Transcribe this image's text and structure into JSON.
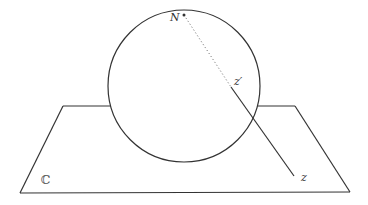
{
  "diagram": {
    "colors": {
      "stroke": "#333333",
      "background": "#ffffff",
      "dotted": "#666666"
    },
    "plane": {
      "label": "ℂ",
      "corners": [
        [
          63,
          106
        ],
        [
          295,
          106
        ],
        [
          350,
          192
        ],
        [
          20,
          193
        ]
      ]
    },
    "sphere": {
      "cx": 184,
      "cy": 86,
      "r": 76
    },
    "points": {
      "north_pole": {
        "label": "N",
        "x": 184,
        "y": 15
      },
      "z_prime": {
        "label": "z′",
        "x": 231,
        "y": 87
      },
      "z": {
        "label": "z",
        "x": 294,
        "y": 176
      }
    }
  }
}
